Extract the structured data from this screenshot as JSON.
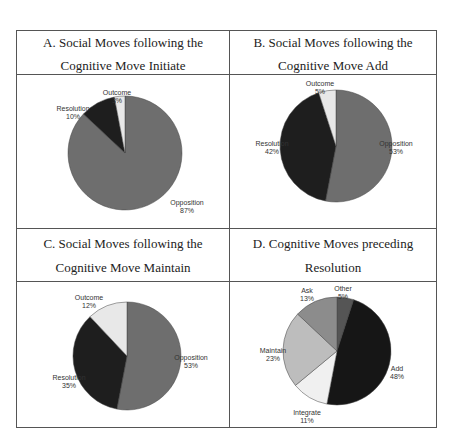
{
  "panels": [
    {
      "title_line1": "A. Social Moves following the",
      "title_line2": "Cognitive Move Initiate"
    },
    {
      "title_line1": "B. Social Moves following the",
      "title_line2": "Cognitive Move Add"
    },
    {
      "title_line1": "C. Social Moves following the",
      "title_line2": "Cognitive Move Maintain"
    },
    {
      "title_line1": "D. Cognitive Moves preceding",
      "title_line2": "Resolution"
    }
  ],
  "chart_data": [
    {
      "type": "pie",
      "title": "A. Social Moves following the Cognitive Move Initiate",
      "categories": [
        "Opposition",
        "Resolution",
        "Outcome"
      ],
      "values": [
        87,
        10,
        3
      ],
      "labels": [
        "87%",
        "10%",
        "3%"
      ],
      "colors": [
        "#6e6e6e",
        "#1e1e1e",
        "#e8e8e8"
      ]
    },
    {
      "type": "pie",
      "title": "B. Social Moves following the Cognitive Move Add",
      "categories": [
        "Opposition",
        "Resolution",
        "Outcome"
      ],
      "values": [
        53,
        42,
        5
      ],
      "labels": [
        "53%",
        "42%",
        "5%"
      ],
      "colors": [
        "#6e6e6e",
        "#1e1e1e",
        "#e8e8e8"
      ]
    },
    {
      "type": "pie",
      "title": "C. Social Moves following the Cognitive Move Maintain",
      "categories": [
        "Opposition",
        "Resolution",
        "Outcome"
      ],
      "values": [
        53,
        35,
        12
      ],
      "labels": [
        "53%",
        "35%",
        "12%"
      ],
      "colors": [
        "#6e6e6e",
        "#1e1e1e",
        "#e8e8e8"
      ]
    },
    {
      "type": "pie",
      "title": "D. Cognitive Moves preceding Resolution",
      "categories": [
        "Other",
        "Add",
        "Integrate",
        "Maintain",
        "Ask"
      ],
      "values": [
        5,
        48,
        11,
        23,
        13
      ],
      "labels": [
        "5%",
        "48%",
        "11%",
        "23%",
        "13%"
      ],
      "colors": [
        "#555555",
        "#161616",
        "#f0f0f0",
        "#bdbdbd",
        "#8c8c8c"
      ]
    }
  ]
}
